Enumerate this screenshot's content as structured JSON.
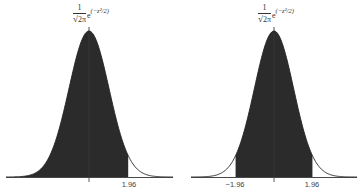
{
  "chart_data": [
    {
      "type": "area",
      "title": "Standard normal density, one-sided shaded region",
      "formula": {
        "numerator": "1",
        "denominator_prefix": "√",
        "denominator_body": "2π",
        "base": "e",
        "exponent": "(−z²/2)"
      },
      "function": "standard_normal_pdf",
      "xlim": [
        -4,
        4
      ],
      "shaded_region": {
        "from": -4,
        "to": 1.96
      },
      "ticks": [
        {
          "x": 0,
          "label": ""
        },
        {
          "x": 1.96,
          "label": "1.96"
        }
      ],
      "grid": false,
      "shaded_area_probability": 0.975
    },
    {
      "type": "area",
      "title": "Standard normal density, two-sided shaded region",
      "formula": {
        "numerator": "1",
        "denominator_prefix": "√",
        "denominator_body": "2π",
        "base": "e",
        "exponent": "(−z²/2)"
      },
      "function": "standard_normal_pdf",
      "xlim": [
        -4,
        4
      ],
      "shaded_region": {
        "from": -1.96,
        "to": 1.96
      },
      "ticks": [
        {
          "x": -1.96,
          "label": "−1.96"
        },
        {
          "x": 0,
          "label": ""
        },
        {
          "x": 1.96,
          "label": "1.96"
        }
      ],
      "grid": false,
      "shaded_area_probability": 0.95
    }
  ],
  "layout": {
    "panels": [
      {
        "center_x": 89,
        "axis_left": 6,
        "axis_right": 173,
        "sigma_px": 20,
        "baseline_y": 177,
        "peak_y": 31
      },
      {
        "center_x": 274,
        "axis_left": 191,
        "axis_right": 357,
        "sigma_px": 19.6,
        "baseline_y": 177,
        "peak_y": 31
      }
    ]
  },
  "colors": {
    "fill": "#2b2b2b",
    "curve": "#222222",
    "axis": "#333333",
    "text": "#444444"
  },
  "labels": {
    "left": {
      "tick_1": "1.96"
    },
    "right": {
      "tick_neg": "−1.96",
      "tick_pos": "1.96"
    }
  },
  "formula": {
    "numerator": "1",
    "sqrt_sign": "√",
    "sqrt_body": "2π",
    "base": "e",
    "exponent": "(−z²/2)"
  }
}
